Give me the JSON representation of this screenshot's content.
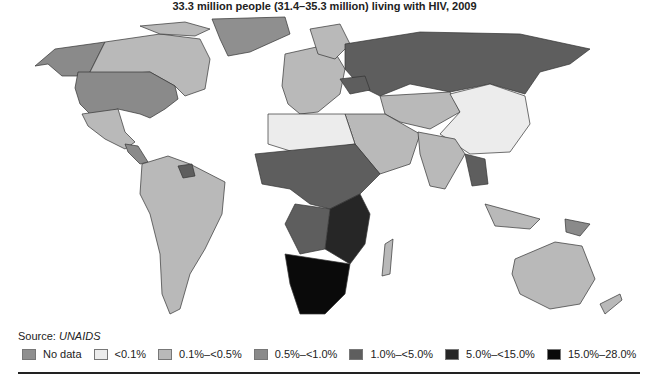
{
  "title": "33.3 million people (31.4–35.3 million) living with HIV, 2009",
  "source": {
    "label": "Source: ",
    "name": "UNAIDS"
  },
  "legend": [
    {
      "label": "No data",
      "color": "#8f8f8f"
    },
    {
      "label": "<0.1%",
      "color": "#ececec"
    },
    {
      "label": "0.1%–<0.5%",
      "color": "#b9b9b9"
    },
    {
      "label": "0.5%–<1.0%",
      "color": "#8a8a8a"
    },
    {
      "label": "1.0%–<5.0%",
      "color": "#5e5e5e"
    },
    {
      "label": "5.0%–<15.0%",
      "color": "#262626"
    },
    {
      "label": "15.0%–28.0%",
      "color": "#0a0a0a"
    }
  ],
  "map": {
    "type": "choropleth",
    "subject": "Adult HIV prevalence by country, 2009",
    "regions": [
      {
        "name": "Canada",
        "class": "0.1%–<0.5%"
      },
      {
        "name": "Alaska (USA)",
        "class": "0.5%–<1.0%"
      },
      {
        "name": "United States",
        "class": "0.5%–<1.0%"
      },
      {
        "name": "Greenland",
        "class": "No data"
      },
      {
        "name": "Mexico",
        "class": "0.1%–<0.5%"
      },
      {
        "name": "Brazil",
        "class": "0.1%–<0.5%"
      },
      {
        "name": "South America (most)",
        "class": "0.1%–<0.5%"
      },
      {
        "name": "Guyana/Suriname",
        "class": "1.0%–<5.0%"
      },
      {
        "name": "Russia",
        "class": "1.0%–<5.0%"
      },
      {
        "name": "Ukraine",
        "class": "1.0%–<5.0%"
      },
      {
        "name": "Western Europe",
        "class": "0.1%–<0.5%"
      },
      {
        "name": "China",
        "class": "<0.1%"
      },
      {
        "name": "Mongolia",
        "class": "<0.1%"
      },
      {
        "name": "India",
        "class": "0.1%–<0.5%"
      },
      {
        "name": "Kazakhstan/Central Asia",
        "class": "0.1%–<0.5%"
      },
      {
        "name": "North Africa",
        "class": "<0.1%"
      },
      {
        "name": "Thailand",
        "class": "1.0%–<5.0%"
      },
      {
        "name": "Myanmar",
        "class": "0.5%–<1.0%"
      },
      {
        "name": "Papua New Guinea",
        "class": "0.5%–<1.0%"
      },
      {
        "name": "Australia",
        "class": "0.1%–<0.5%"
      },
      {
        "name": "New Zealand",
        "class": "0.1%–<0.5%"
      },
      {
        "name": "Madagascar",
        "class": "0.1%–<0.5%"
      },
      {
        "name": "West & Central Africa",
        "class": "1.0%–<5.0%"
      },
      {
        "name": "East Africa",
        "class": "5.0%–<15.0%"
      },
      {
        "name": "Southern Africa",
        "class": "15.0%–28.0%"
      }
    ]
  }
}
